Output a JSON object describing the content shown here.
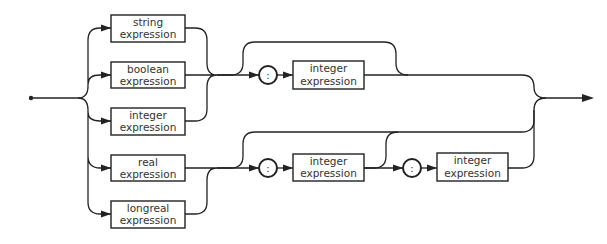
{
  "diagram": {
    "type": "syntax-diagram",
    "colors": {
      "stroke": "#222222",
      "text": "#333333",
      "background": "#ffffff"
    },
    "entry_boxes": [
      {
        "line1": "string",
        "line2": "expression"
      },
      {
        "line1": "boolean",
        "line2": "expression"
      },
      {
        "line1": "integer",
        "line2": "expression"
      },
      {
        "line1": "real",
        "line2": "expression"
      },
      {
        "line1": "longreal",
        "line2": "expression"
      }
    ],
    "upper_branch": {
      "separator": ":",
      "box": {
        "line1": "integer",
        "line2": "expression"
      }
    },
    "lower_branch": {
      "separator1": ":",
      "box1": {
        "line1": "integer",
        "line2": "expression"
      },
      "separator2": ":",
      "box2": {
        "line1": "integer",
        "line2": "expression"
      }
    }
  }
}
